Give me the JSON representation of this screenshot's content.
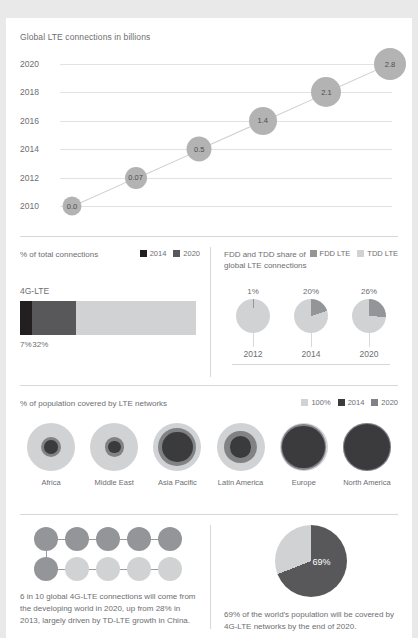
{
  "colors": {
    "dark": "#231f20",
    "mid_dark": "#58585b",
    "mid": "#939598",
    "light": "#d1d2d4",
    "lighter": "#e3e3e3",
    "bubble": "#b3b3b3",
    "grid": "#e2e2e2",
    "text": "#6d6e71"
  },
  "section_line": {
    "title": "Global LTE connections in billions",
    "chart_data": {
      "type": "scatter",
      "title": "Global LTE connections in billions",
      "xlabel": "",
      "ylabel": "",
      "grid": true,
      "legend": "none",
      "categories": [
        "2010",
        "2012",
        "2014",
        "2016",
        "2018",
        "2020"
      ],
      "values": [
        0.0,
        0.07,
        0.5,
        1.4,
        2.1,
        2.8
      ],
      "point_labels": [
        "0.0",
        "0.07",
        "0.5",
        "1.4",
        "2.1",
        "2.8"
      ],
      "ytick_labels": [
        "2010",
        "2012",
        "2014",
        "2016",
        "2018",
        "2020"
      ]
    }
  },
  "section_bar": {
    "label": "% of total connections",
    "legend": [
      {
        "name": "2014",
        "color": "#231f20"
      },
      {
        "name": "2020",
        "color": "#58585b"
      }
    ],
    "bar_title": "4G-LTE",
    "chart_data": {
      "type": "bar",
      "title": "% of total connections",
      "categories": [
        "2014",
        "2020"
      ],
      "values": [
        7,
        32
      ],
      "value_labels": [
        "7%",
        "32%"
      ],
      "ylim": [
        0,
        100
      ],
      "remainder_color": "#d1d2d4"
    }
  },
  "section_pies": {
    "label_line1": "FDD and TDD share of",
    "label_line2": "global LTE connections",
    "legend": [
      {
        "name": "FDD LTE",
        "color": "#939598"
      },
      {
        "name": "TDD LTE",
        "color": "#d1d2d4"
      }
    ],
    "chart_data": {
      "type": "pie",
      "title": "FDD and TDD share of global LTE connections",
      "categories": [
        "2012",
        "2014",
        "2020"
      ],
      "series": [
        {
          "name": "FDD LTE",
          "values": [
            1,
            20,
            26
          ]
        },
        {
          "name": "TDD LTE",
          "values": [
            99,
            80,
            74
          ]
        }
      ],
      "value_labels": [
        "1%",
        "20%",
        "26%"
      ]
    }
  },
  "section_coverage": {
    "label": "% of population covered by LTE networks",
    "legend": [
      {
        "name": "100%",
        "color": "#d1d2d4"
      },
      {
        "name": "2014",
        "color": "#3b3b3d"
      },
      {
        "name": "2020",
        "color": "#808285"
      }
    ],
    "chart_data": {
      "type": "bubble",
      "title": "% of population covered by LTE networks",
      "categories": [
        "Africa",
        "Middle East",
        "Asia Pacific",
        "Latin America",
        "Europe",
        "North America"
      ],
      "series": [
        {
          "name": "100%",
          "values": [
            100,
            100,
            100,
            100,
            100,
            100
          ]
        },
        {
          "name": "2020",
          "values": [
            18,
            16,
            62,
            45,
            88,
            97
          ]
        },
        {
          "name": "2014",
          "values": [
            8,
            7,
            40,
            20,
            80,
            92
          ]
        }
      ]
    }
  },
  "section_dots": {
    "caption": "6 in 10 global 4G-LTE connections will come from the developing world in 2020, up from 28% in 2013, largely driven by TD-LTE growth in China.",
    "chart_data": {
      "type": "pictogram",
      "filled": 6,
      "total": 10,
      "filled_color": "#939598",
      "empty_color": "#d1d2d4"
    }
  },
  "section_bigpie": {
    "value_label": "69%",
    "caption": "69% of the world's population will be covered by 4G-LTE networks by the end of 2020.",
    "chart_data": {
      "type": "pie",
      "categories": [
        "Covered",
        "Not covered"
      ],
      "values": [
        69,
        31
      ],
      "colors": [
        "#58585b",
        "#d1d2d4"
      ]
    }
  }
}
